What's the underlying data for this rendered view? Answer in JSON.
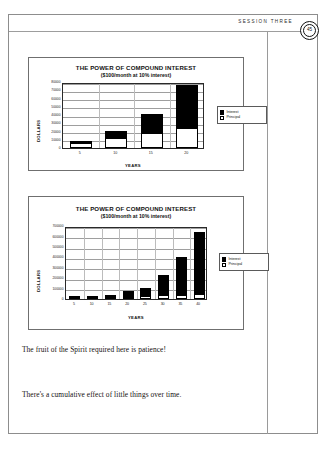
{
  "page": {
    "running_head": "SESSION THREE",
    "folio": "45"
  },
  "body": {
    "lines": [
      "The fruit of the Spirit required here is patience!",
      "There's a cumulative effect of little things over time."
    ]
  },
  "legend": {
    "interest_label": "Interest",
    "principal_label": "Principal",
    "interest_color": "#000000",
    "principal_color": "#ffffff"
  },
  "chart_data": [
    {
      "id": "chart-20-year",
      "type": "bar",
      "stacked": true,
      "title": "THE POWER OF COMPOUND INTEREST",
      "subtitle": "($100/month at 10% interest)",
      "xlabel": "YEARS",
      "ylabel": "DOLLARS",
      "categories": [
        "5",
        "10",
        "15",
        "20"
      ],
      "yticks": [
        "0",
        "10000",
        "20000",
        "30000",
        "40000",
        "50000",
        "60000",
        "70000",
        "80000"
      ],
      "ylim": [
        0,
        80000
      ],
      "grid": true,
      "legend_position": "right",
      "series": [
        {
          "name": "Principal",
          "values": [
            6000,
            12000,
            18000,
            24000
          ]
        },
        {
          "name": "Interest",
          "values": [
            1800,
            8500,
            23000,
            52000
          ]
        }
      ],
      "totals": [
        7800,
        20500,
        41000,
        76000
      ]
    },
    {
      "id": "chart-40-year",
      "type": "bar",
      "stacked": true,
      "title": "THE POWER OF COMPOUND INTEREST",
      "subtitle": "($100/month at 10% interest)",
      "xlabel": "YEARS",
      "ylabel": "DOLLARS",
      "categories": [
        "5",
        "10",
        "15",
        "20",
        "25",
        "30",
        "35",
        "40"
      ],
      "yticks": [
        "0",
        "100000",
        "200000",
        "300000",
        "400000",
        "500000",
        "600000",
        "700000"
      ],
      "ylim": [
        0,
        700000
      ],
      "grid": true,
      "legend_position": "right",
      "series": [
        {
          "name": "Principal",
          "values": [
            6000,
            12000,
            18000,
            24000,
            30000,
            36000,
            42000,
            48000
          ]
        },
        {
          "name": "Interest",
          "values": [
            1800,
            8500,
            23000,
            52000,
            76000,
            190000,
            360000,
            590000
          ]
        }
      ],
      "totals": [
        7800,
        20500,
        41000,
        76000,
        106000,
        226000,
        402000,
        638000
      ]
    }
  ]
}
